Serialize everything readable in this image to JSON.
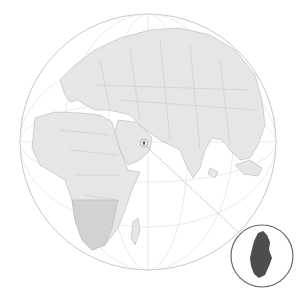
{
  "map": {
    "type": "orthographic-locator",
    "highlighted_country": "Qatar",
    "colors": {
      "ocean": "#ffffff",
      "land": "#e6e6e6",
      "land_africa_south": "#cfcfcf",
      "borders": "#b8b8b8",
      "graticule": "#d9d9d9",
      "globe_outline": "#c8c8c8",
      "highlight": "#4d4d4d",
      "inset_border": "#666666",
      "leader_line": "#888888"
    },
    "globe": {
      "cx": 148,
      "cy": 142,
      "r": 128
    },
    "inset": {
      "cx": 262,
      "cy": 256,
      "r": 31
    }
  }
}
